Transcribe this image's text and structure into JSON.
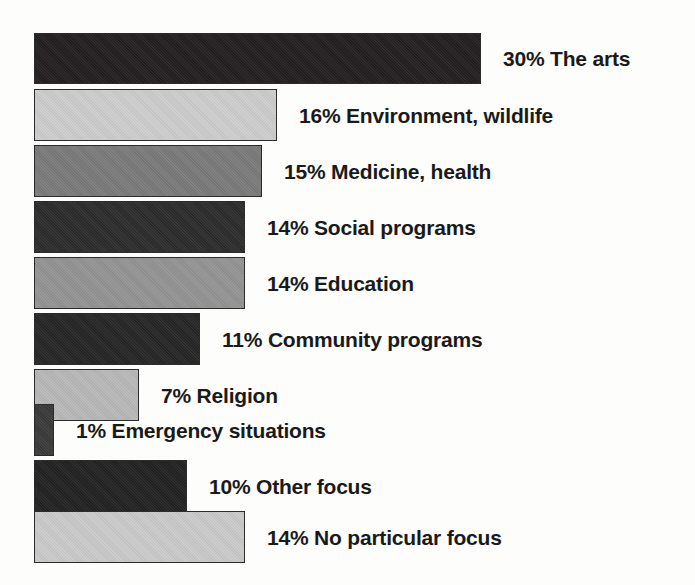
{
  "chart_data": {
    "type": "bar",
    "orientation": "horizontal",
    "title": "",
    "subtitle": "",
    "xlabel": "",
    "ylabel": "",
    "grid": false,
    "legend": "none",
    "axis_visible": false,
    "value_suffix": "%",
    "xlim": [
      0,
      30
    ],
    "categories": [
      "The arts",
      "Environment, wildlife",
      "Medicine, health",
      "Social programs",
      "Education",
      "Community programs",
      "Religion",
      "Emergency situations",
      "Other focus",
      "No particular focus"
    ],
    "values": [
      30,
      16,
      15,
      14,
      14,
      11,
      7,
      1,
      10,
      14
    ],
    "bars": [
      {
        "label": "The arts",
        "value": 30,
        "value_text": "30%",
        "label_text": "30% The arts",
        "color": "#231f20",
        "bar_width_px": 447,
        "top_px": 33,
        "height_px": 51
      },
      {
        "label": "Environment, wildlife",
        "value": 16,
        "value_text": "16%",
        "label_text": "16% Environment, wildlife",
        "color": "#cdcdcd",
        "bar_width_px": 243,
        "top_px": 89,
        "height_px": 52
      },
      {
        "label": "Medicine, health",
        "value": 15,
        "value_text": "15%",
        "label_text": "15% Medicine, health",
        "color": "#7a7a7a",
        "bar_width_px": 228,
        "top_px": 145,
        "height_px": 52
      },
      {
        "label": "Social programs",
        "value": 14,
        "value_text": "14%",
        "label_text": "14% Social programs",
        "color": "#2c2c2c",
        "bar_width_px": 211,
        "top_px": 201,
        "height_px": 52
      },
      {
        "label": "Education",
        "value": 14,
        "value_text": "14%",
        "label_text": "14% Education",
        "color": "#949494",
        "bar_width_px": 211,
        "top_px": 257,
        "height_px": 52
      },
      {
        "label": "Community programs",
        "value": 11,
        "value_text": "11%",
        "label_text": "11% Community programs",
        "color": "#262626",
        "bar_width_px": 166,
        "top_px": 313,
        "height_px": 52
      },
      {
        "label": "Religion",
        "value": 7,
        "value_text": "7%",
        "label_text": "7% Religion",
        "color": "#b8b8b8",
        "bar_width_px": 105,
        "top_px": 369,
        "height_px": 52
      },
      {
        "label": "Emergency situations",
        "value": 1,
        "value_text": "1%",
        "label_text": "1% Emergency situations",
        "color": "#3a3a3a",
        "bar_width_px": 20,
        "top_px": 404,
        "height_px": 52
      },
      {
        "label": "Other focus",
        "value": 10,
        "value_text": "10%",
        "label_text": "10% Other focus",
        "color": "#222222",
        "bar_width_px": 153,
        "top_px": 460,
        "height_px": 52
      },
      {
        "label": "No particular focus",
        "value": 14,
        "value_text": "14%",
        "label_text": "14% No particular focus",
        "color": "#cacaca",
        "bar_width_px": 211,
        "top_px": 511,
        "height_px": 52
      }
    ]
  },
  "layout": {
    "bar_left_px": 34
  }
}
